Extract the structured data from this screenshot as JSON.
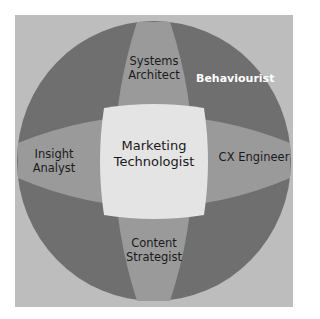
{
  "diagram": {
    "type": "venn-style role circle",
    "colors": {
      "background_frame": "#bdbdbd",
      "outer_circle": "#6f6f6f",
      "bands": "#9a9a9a",
      "center": "#e4e4e4",
      "label_text": "#1a1a1a",
      "label_text_light": "#ffffff"
    },
    "center": {
      "line1": "Marketing",
      "line2": "Technologist"
    },
    "top": {
      "line1": "Systems",
      "line2": "Architect"
    },
    "bottom": {
      "line1": "Content",
      "line2": "Strategist"
    },
    "left": {
      "line1": "Insight",
      "line2": "Analyst"
    },
    "right": {
      "line1": "CX Engineer"
    },
    "outer_quadrant_top_right": {
      "line1": "Behaviourist"
    }
  }
}
